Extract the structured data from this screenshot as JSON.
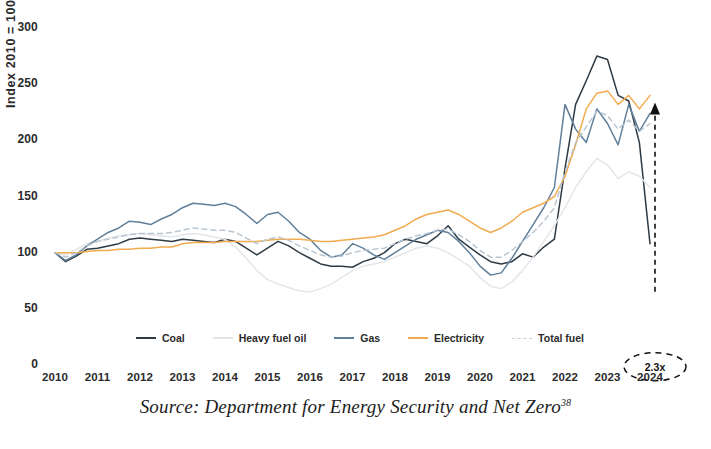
{
  "chart_data": {
    "type": "line",
    "title": "",
    "xlabel": "",
    "ylabel": "Index 2010 = 100",
    "xlim": [
      2010,
      2024
    ],
    "ylim": [
      0,
      300
    ],
    "grid": false,
    "legend_position": "bottom",
    "x_tick_labels": [
      "2010",
      "2011",
      "2012",
      "2013",
      "2014",
      "2015",
      "2016",
      "2017",
      "2018",
      "2019",
      "2020",
      "2021",
      "2022",
      "2023",
      "2024"
    ],
    "y_tick_labels": [
      "0",
      "50",
      "100",
      "150",
      "200",
      "250",
      "300"
    ],
    "y_tick_values": [
      0,
      50,
      100,
      150,
      200,
      250,
      300
    ],
    "x": [
      2010,
      2010.25,
      2010.5,
      2010.75,
      2011,
      2011.25,
      2011.5,
      2011.75,
      2012,
      2012.25,
      2012.5,
      2012.75,
      2013,
      2013.25,
      2013.5,
      2013.75,
      2014,
      2014.25,
      2014.5,
      2014.75,
      2015,
      2015.25,
      2015.5,
      2015.75,
      2016,
      2016.25,
      2016.5,
      2016.75,
      2017,
      2017.25,
      2017.5,
      2017.75,
      2018,
      2018.25,
      2018.5,
      2018.75,
      2019,
      2019.25,
      2019.5,
      2019.75,
      2020,
      2020.25,
      2020.5,
      2020.75,
      2021,
      2021.25,
      2021.5,
      2021.75,
      2022,
      2022.25,
      2022.5,
      2022.75,
      2023,
      2023.25,
      2023.5,
      2023.75,
      2024
    ],
    "series": [
      {
        "name": "Coal",
        "color": "#2e3b45",
        "style": "solid",
        "values": [
          100,
          92,
          97,
          103,
          104,
          106,
          108,
          112,
          113,
          112,
          111,
          110,
          112,
          111,
          110,
          109,
          112,
          110,
          104,
          98,
          104,
          110,
          106,
          100,
          95,
          90,
          88,
          88,
          87,
          92,
          95,
          100,
          108,
          112,
          110,
          108,
          115,
          124,
          112,
          105,
          98,
          92,
          90,
          92,
          99,
          96,
          105,
          112,
          175,
          232,
          253,
          275,
          272,
          240,
          235,
          198,
          108
        ]
      },
      {
        "name": "Heavy fuel oil",
        "color": "#e4e6ea",
        "style": "solid",
        "values": [
          100,
          98,
          103,
          108,
          110,
          113,
          115,
          116,
          117,
          116,
          115,
          114,
          116,
          117,
          116,
          114,
          112,
          105,
          95,
          84,
          76,
          72,
          69,
          66,
          65,
          68,
          72,
          78,
          84,
          88,
          90,
          92,
          96,
          100,
          104,
          106,
          104,
          100,
          94,
          88,
          78,
          70,
          68,
          74,
          84,
          96,
          110,
          124,
          140,
          158,
          172,
          184,
          178,
          166,
          172,
          168,
          158
        ]
      },
      {
        "name": "Gas",
        "color": "#5f7f9a",
        "style": "solid",
        "values": [
          100,
          93,
          98,
          106,
          112,
          118,
          122,
          128,
          127,
          125,
          130,
          134,
          140,
          144,
          143,
          142,
          144,
          141,
          134,
          126,
          134,
          136,
          128,
          118,
          112,
          102,
          96,
          98,
          108,
          104,
          98,
          94,
          100,
          106,
          112,
          116,
          120,
          118,
          110,
          100,
          88,
          80,
          82,
          95,
          110,
          125,
          140,
          158,
          232,
          210,
          198,
          228,
          215,
          196,
          232,
          208,
          224
        ]
      },
      {
        "name": "Electricity",
        "color": "#f0ab4f",
        "style": "solid",
        "values": [
          100,
          100,
          100,
          101,
          102,
          102,
          103,
          103,
          104,
          104,
          105,
          105,
          108,
          109,
          109,
          109,
          110,
          110,
          110,
          110,
          111,
          112,
          112,
          112,
          111,
          110,
          110,
          111,
          112,
          113,
          114,
          116,
          120,
          124,
          130,
          134,
          136,
          138,
          134,
          128,
          122,
          118,
          122,
          128,
          136,
          140,
          144,
          150,
          168,
          196,
          228,
          242,
          244,
          232,
          240,
          228,
          240
        ]
      },
      {
        "name": "Total fuel",
        "color": "#b9c6d2",
        "style": "dashed",
        "values": [
          100,
          96,
          100,
          106,
          110,
          112,
          114,
          116,
          117,
          117,
          117,
          118,
          120,
          122,
          121,
          120,
          120,
          118,
          113,
          108,
          112,
          114,
          111,
          106,
          102,
          98,
          96,
          97,
          100,
          102,
          103,
          104,
          108,
          112,
          115,
          117,
          120,
          121,
          116,
          110,
          102,
          96,
          96,
          102,
          110,
          118,
          128,
          140,
          172,
          198,
          212,
          226,
          222,
          210,
          218,
          208,
          215
        ]
      }
    ],
    "annotations": [
      {
        "name": "ratio-callout",
        "label": "2.3x",
        "kind": "dashed-arrow-with-ellipse",
        "x": 2024,
        "y_from": 108,
        "y_to": 232
      }
    ]
  },
  "axis": {
    "y_title": "Index 2010 = 100"
  },
  "legend": {
    "items": [
      {
        "label": "Coal",
        "color": "#2e3b45",
        "style": "solid"
      },
      {
        "label": "Heavy fuel oil",
        "color": "#e0e3e8",
        "style": "solid"
      },
      {
        "label": "Gas",
        "color": "#5f7f9a",
        "style": "solid"
      },
      {
        "label": "Electricity",
        "color": "#f0ab4f",
        "style": "solid"
      },
      {
        "label": "Total fuel",
        "color": "#c2cdd8",
        "style": "dashed"
      }
    ]
  },
  "source": {
    "prefix": "Source: Department for Energy Security and Net Zero",
    "footnote": "38"
  }
}
